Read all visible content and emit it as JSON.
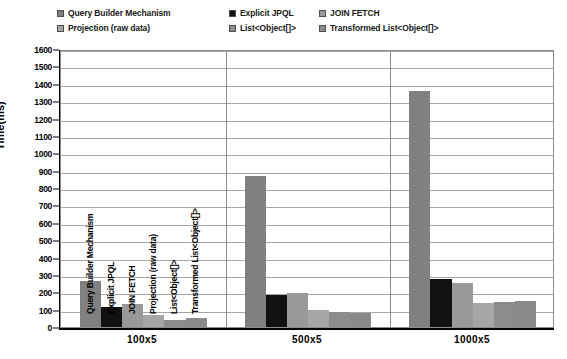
{
  "chart_data": {
    "type": "bar",
    "title": "",
    "xlabel": "",
    "ylabel": "Time(ms)",
    "ylim": [
      0,
      1600
    ],
    "ytick_step": 100,
    "grid": true,
    "legend_position": "top",
    "categories": [
      "100x5",
      "500x5",
      "1000x5"
    ],
    "series": [
      {
        "name": "Query Builder Mechanism",
        "color": "#808080",
        "values": [
          265,
          870,
          1360
        ]
      },
      {
        "name": "Explicit JPQL",
        "color": "#111111",
        "values": [
          115,
          185,
          275
        ]
      },
      {
        "name": "JOIN FETCH",
        "color": "#999999",
        "values": [
          133,
          195,
          255
        ]
      },
      {
        "name": "Projection (raw data)",
        "color": "#a6a6a6",
        "values": [
          70,
          100,
          140
        ]
      },
      {
        "name": "List<Object[]>",
        "color": "#8c8c8c",
        "values": [
          40,
          87,
          145
        ]
      },
      {
        "name": "Transformed List<Object[]>",
        "color": "#8a8a8a",
        "values": [
          52,
          82,
          150
        ]
      }
    ],
    "ytick_labels": [
      "0",
      "100",
      "200",
      "300",
      "400",
      "500",
      "600",
      "700",
      "800",
      "900",
      "1000",
      "1100",
      "1200",
      "1300",
      "1400",
      "1500",
      "1600"
    ],
    "in_plot_series_labels": [
      "Query Builder Mechanism",
      "Explicit JPQL",
      "JOIN FETCH",
      "Projection (raw data)",
      "List<Object[]>",
      "Transformed List<Object[]>"
    ]
  },
  "legend": {
    "rows": [
      [
        {
          "label": "Query Builder Mechanism",
          "color": "#808080"
        },
        {
          "label": "Explicit JPQL",
          "color": "#111111"
        },
        {
          "label": "JOIN FETCH",
          "color": "#999999"
        }
      ],
      [
        {
          "label": "Projection (raw data)",
          "color": "#a6a6a6"
        },
        {
          "label": "List<Object[]>",
          "color": "#8c8c8c"
        },
        {
          "label": "Transformed List<Object[]>",
          "color": "#8a8a8a"
        }
      ]
    ]
  }
}
